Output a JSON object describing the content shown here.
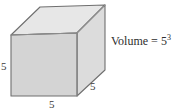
{
  "figure": {
    "name": "cube-volume-diagram",
    "labels": {
      "left_edge": "5",
      "bottom_edge": "5",
      "right_edge": "5"
    },
    "volume": {
      "base_text": "Volume = 5",
      "exponent": "3"
    },
    "top_cropped_artifact": "",
    "colors": {
      "front_face": "#d4d4d4",
      "top_face": "#e7e7e7",
      "side_face": "#dcdcdc",
      "outline": "#6f6f6f",
      "inner_edge": "#9a9a9a",
      "background": "#ffffff",
      "label_text": "#3a3a3a"
    },
    "geometry": {
      "front_face": "11,35 77,33 77,96 11,96",
      "top_face": "11,35 40,7 105,5 77,33",
      "side_face": "77,33 105,5 105,70 77,96"
    }
  }
}
